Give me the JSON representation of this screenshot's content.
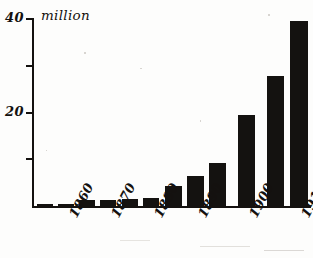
{
  "chart_data": {
    "type": "bar",
    "title": "",
    "subtitle": "",
    "xlabel": "",
    "ylabel": "million",
    "unit_label": "million",
    "ylim": [
      0,
      40
    ],
    "yticks": [
      0,
      10,
      20,
      30,
      40
    ],
    "ytick_labels": [
      "",
      "",
      "20",
      "",
      "40"
    ],
    "grid": false,
    "legend": null,
    "categories": [
      "1855",
      "1860",
      "1865",
      "1870",
      "1875",
      "1880",
      "1885",
      "1890",
      "1895",
      "1900",
      "1905",
      "1910"
    ],
    "xtick_labels": [
      "1860",
      "1870",
      "1880",
      "1890",
      "1900",
      "1910"
    ],
    "values": [
      0.5,
      0.5,
      1.3,
      1.3,
      1.6,
      1.8,
      4.2,
      6.5,
      9.3,
      19.5,
      27.8,
      39.5
    ],
    "bars": [
      {
        "label": "1855",
        "value": 0.5,
        "left": 37,
        "width": 16
      },
      {
        "label": "1860",
        "value": 0.5,
        "left": 58,
        "width": 16
      },
      {
        "label": "1865",
        "value": 1.3,
        "left": 79,
        "width": 16
      },
      {
        "label": "1870",
        "value": 1.3,
        "left": 100,
        "width": 16
      },
      {
        "label": "1875",
        "value": 1.6,
        "left": 122,
        "width": 16
      },
      {
        "label": "1880",
        "value": 1.8,
        "left": 143,
        "width": 16
      },
      {
        "label": "1885",
        "value": 4.2,
        "left": 165,
        "width": 17
      },
      {
        "label": "1890",
        "value": 6.5,
        "left": 187,
        "width": 17
      },
      {
        "label": "1895",
        "value": 9.3,
        "left": 209,
        "width": 17
      },
      {
        "label": "1900",
        "value": 19.5,
        "left": 238,
        "width": 17
      },
      {
        "label": "1905",
        "value": 27.8,
        "left": 267,
        "width": 17
      },
      {
        "label": "1910",
        "value": 39.5,
        "left": 290,
        "width": 18
      }
    ],
    "axis": {
      "y_top_px": 19,
      "y_base_px": 206,
      "y_top_value": 40,
      "y_base_value": 0
    }
  },
  "ylabels": {
    "top": "40",
    "mid": "20",
    "unit": "million"
  },
  "xlabels": {
    "t1860": "1860",
    "t1870": "1870",
    "t1880": "1880",
    "t1890": "1890",
    "t1900": "1900",
    "t1910": "1910"
  }
}
